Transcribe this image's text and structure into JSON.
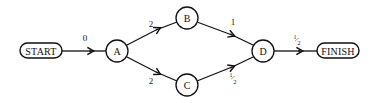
{
  "diagram": {
    "nodes": {
      "start": {
        "label": "START",
        "shape": "pill"
      },
      "a": {
        "label": "A",
        "shape": "circle"
      },
      "b": {
        "label": "B",
        "shape": "circle"
      },
      "c": {
        "label": "C",
        "shape": "circle"
      },
      "d": {
        "label": "D",
        "shape": "circle"
      },
      "finish": {
        "label": "FINISH",
        "shape": "pill"
      }
    },
    "edges": {
      "start_a": {
        "from": "START",
        "to": "A",
        "weight": "0"
      },
      "a_b": {
        "from": "A",
        "to": "B",
        "weight": "2"
      },
      "a_c": {
        "from": "A",
        "to": "C",
        "weight": "2"
      },
      "b_d": {
        "from": "B",
        "to": "D",
        "weight": "1"
      },
      "c_d": {
        "from": "C",
        "to": "D",
        "weight": "½",
        "weight_num": "1",
        "weight_den": "2"
      },
      "d_finish": {
        "from": "D",
        "to": "FINISH",
        "weight": "½",
        "weight_num": "1",
        "weight_den": "2"
      }
    },
    "colors": {
      "stroke": "#111111",
      "background": "#ffffff"
    }
  }
}
